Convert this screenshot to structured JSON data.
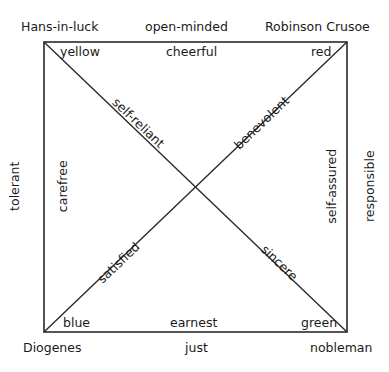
{
  "diagram": {
    "corners": {
      "top_left": "Hans-in-luck",
      "top_right": "Robinson Crusoe",
      "bottom_left": "Diogenes",
      "bottom_right": "nobleman"
    },
    "corner_colors": {
      "top_left": "yellow",
      "top_right": "red",
      "bottom_left": "blue",
      "bottom_right": "green"
    },
    "outer_sides": {
      "top": "open-minded",
      "bottom": "just",
      "left": "tolerant",
      "right": "responsible"
    },
    "inner_sides": {
      "top": "cheerful",
      "bottom": "earnest",
      "left": "carefree",
      "right": "self-assured"
    },
    "diagonals": {
      "top_left_arm": "self-reliant",
      "top_right_arm": "benevolent",
      "bottom_left_arm": "satisfied",
      "bottom_right_arm": "sincere"
    }
  }
}
